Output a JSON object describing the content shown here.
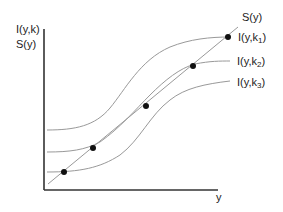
{
  "diagram": {
    "y_axis_label_line1": "I(y,k)",
    "y_axis_label_line2": "S(y)",
    "x_axis_label": "y",
    "saving_curve_label": "S(y)",
    "curves": [
      {
        "label_prefix": "I(y,k",
        "subscript": "1",
        "label_suffix": ")"
      },
      {
        "label_prefix": "I(y,k",
        "subscript": "2",
        "label_suffix": ")"
      },
      {
        "label_prefix": "I(y,k",
        "subscript": "3",
        "label_suffix": ")"
      }
    ],
    "colors": {
      "axis": "#333333",
      "curve": "#999999",
      "dot": "#111111"
    }
  }
}
